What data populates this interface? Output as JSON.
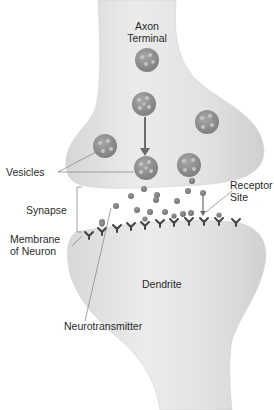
{
  "diagram": {
    "labels": {
      "axon_terminal_line1": "Axon",
      "axon_terminal_line2": "Terminal",
      "vesicles": "Vesicles",
      "receptor_site_line1": "Receptor",
      "receptor_site_line2": "Site",
      "synapse": "Synapse",
      "membrane_line1": "Membrane",
      "membrane_line2": "of Neuron",
      "dendrite": "Dendrite",
      "neurotransmitter": "Neurotransmitter"
    },
    "colors": {
      "neuron_fill": "#e4e4e4",
      "neuron_shade": "#d2d2d2",
      "vesicle_fill": "#8c8c8c",
      "vesicle_dot": "#bdbdbd",
      "neurotransmitter": "#7a7a7a",
      "receptor": "#444444",
      "arrow": "#6b6b6b",
      "leader_line": "#8a8a8a"
    }
  }
}
